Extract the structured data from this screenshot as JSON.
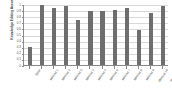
{
  "chart_data": {
    "type": "bar",
    "title": "",
    "xlabel": "",
    "ylabel": "Knowledge Editing Accuracy",
    "ylim": [
      0,
      1.0
    ],
    "grid": true,
    "legend": "none",
    "bar_color": "#6e6e6e",
    "axis_color": "#8a8a8a",
    "grid_color": "#d8d8d8",
    "ytick_labels": [
      "1",
      "0.9",
      "0.8",
      "0.7",
      "0.6",
      "0.5",
      "0.4",
      "0.3",
      "0.2",
      "0.1",
      "0"
    ],
    "ytick_values": [
      1.0,
      0.9,
      0.8,
      0.7,
      0.6,
      0.5,
      0.4,
      0.3,
      0.2,
      0.1,
      0.0
    ],
    "categories": [
      "Base",
      "Method 1",
      "Method 2",
      "Method 3",
      "Method 4",
      "Method 5",
      "Method 6",
      "Method 7",
      "Method 8",
      "Method 9",
      "Method 10",
      "Method 11"
    ],
    "values": [
      0.3,
      0.98,
      0.93,
      0.96,
      0.73,
      0.88,
      0.88,
      0.9,
      0.94,
      0.58,
      0.85,
      0.97
    ]
  }
}
